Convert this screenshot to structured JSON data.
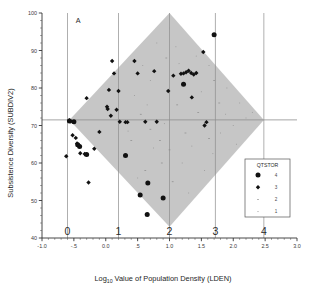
{
  "chart_data": {
    "type": "scatter",
    "title": "",
    "panel_label": "A",
    "xlabel": "Log10 Value of Population Density (LDEN)",
    "xlabel_parts": {
      "pre": "Log",
      "sub": "10",
      "post": " Value of Population Density (LDEN)"
    },
    "ylabel": "Subsistence Diversity (SUBDIV2)",
    "xlim": [
      -1.0,
      3.0
    ],
    "ylim": [
      40,
      100
    ],
    "x_ticks": [
      -1.0,
      -0.5,
      0.0,
      0.5,
      1.0,
      1.5,
      2.0,
      2.5,
      3.0
    ],
    "x_tick_labels": [
      "-1.0",
      "-.5",
      "0.0",
      ".5",
      "1.0",
      "1.5",
      "2.0",
      "2.5",
      "3.0"
    ],
    "x_minor_step": 0.1,
    "y_ticks": [
      40,
      50,
      60,
      70,
      80,
      90,
      100
    ],
    "y_tick_labels": [
      "40",
      "50",
      "60",
      "70",
      "80",
      "90",
      "100"
    ],
    "y_minor_step": 2,
    "grid": "reference-lines-only",
    "secondary_x_axis": {
      "note": "Untransformed population density class labels drawn above the x axis",
      "labels": [
        "0",
        "1",
        "2",
        "3",
        "4"
      ],
      "x_positions": [
        -0.6,
        0.2,
        1.0,
        1.72,
        2.48
      ]
    },
    "reference_lines": {
      "horizontal_y": 71.5,
      "vertical_x": [
        -0.6,
        0.2,
        1.0,
        1.72,
        2.48
      ]
    },
    "shaded_region": {
      "shape": "diamond",
      "fill": "#c6c6c6",
      "vertices": [
        [
          1.0,
          100.0
        ],
        [
          2.48,
          71.5
        ],
        [
          1.0,
          43.0
        ],
        [
          -0.57,
          71.5
        ]
      ]
    },
    "legend": {
      "title": "QTSTOR",
      "position": "right-inside",
      "entries": [
        {
          "label": "4",
          "marker": "circle",
          "size": 5.0
        },
        {
          "label": "3",
          "marker": "diamond",
          "size": 4.4
        },
        {
          "label": "2",
          "marker": "dash",
          "size": 1.8
        },
        {
          "label": "1",
          "marker": "dot",
          "size": 1.0
        }
      ]
    },
    "series": [
      {
        "name": "QTSTOR = 4",
        "marker": "circle",
        "color": "#111111",
        "points": [
          [
            -0.57,
            71.2
          ],
          [
            -0.5,
            71.0
          ],
          [
            -0.44,
            64.9
          ],
          [
            -0.41,
            64.4
          ],
          [
            -0.3,
            62.3
          ],
          [
            0.31,
            62.0
          ],
          [
            0.66,
            54.7
          ],
          [
            0.9,
            50.7
          ],
          [
            0.54,
            51.5
          ],
          [
            0.65,
            46.3
          ],
          [
            1.22,
            81.0
          ],
          [
            1.7,
            94.2
          ]
        ]
      },
      {
        "name": "QTSTOR = 3",
        "marker": "diamond",
        "color": "#111111",
        "points": [
          [
            -0.62,
            61.8
          ],
          [
            -0.57,
            71.4
          ],
          [
            -0.55,
            71.1
          ],
          [
            -0.52,
            67.4
          ],
          [
            -0.47,
            66.7
          ],
          [
            -0.45,
            65.2
          ],
          [
            -0.42,
            64.6
          ],
          [
            -0.4,
            62.6
          ],
          [
            -0.33,
            62.4
          ],
          [
            -0.3,
            77.3
          ],
          [
            -0.27,
            54.8
          ],
          [
            -0.18,
            63.8
          ],
          [
            -0.1,
            68.3
          ],
          [
            0.02,
            75.0
          ],
          [
            0.03,
            74.4
          ],
          [
            0.05,
            79.5
          ],
          [
            0.08,
            72.6
          ],
          [
            0.1,
            87.2
          ],
          [
            0.13,
            83.9
          ],
          [
            0.17,
            74.2
          ],
          [
            0.2,
            79.2
          ],
          [
            0.22,
            71.0
          ],
          [
            0.31,
            70.9
          ],
          [
            0.34,
            70.9
          ],
          [
            0.45,
            87.2
          ],
          [
            0.5,
            83.9
          ],
          [
            0.62,
            71.0
          ],
          [
            0.8,
            71.0
          ],
          [
            0.76,
            84.5
          ],
          [
            0.98,
            79.2
          ],
          [
            1.06,
            83.3
          ],
          [
            1.18,
            83.8
          ],
          [
            1.22,
            83.9
          ],
          [
            1.26,
            84.2
          ],
          [
            1.3,
            84.6
          ],
          [
            1.34,
            84.0
          ],
          [
            1.38,
            83.6
          ],
          [
            1.42,
            84.0
          ],
          [
            1.35,
            77.5
          ],
          [
            1.53,
            89.6
          ],
          [
            1.55,
            70.0
          ],
          [
            1.58,
            70.9
          ]
        ]
      },
      {
        "name": "QTSTOR = 2",
        "marker": "dash",
        "color": "#8a8a8a",
        "points": [
          [
            0.55,
            73.0
          ],
          [
            0.7,
            69.0
          ],
          [
            0.85,
            66.0
          ],
          [
            1.0,
            63.5
          ],
          [
            1.12,
            75.5
          ],
          [
            1.25,
            68.0
          ],
          [
            0.62,
            58.0
          ],
          [
            0.95,
            88.0
          ],
          [
            1.45,
            73.5
          ],
          [
            1.62,
            66.5
          ],
          [
            0.4,
            66.0
          ],
          [
            1.78,
            76.0
          ],
          [
            0.88,
            60.0
          ],
          [
            1.05,
            55.0
          ],
          [
            1.7,
            82.0
          ]
        ]
      },
      {
        "name": "QTSTOR = 1",
        "marker": "dot",
        "color": "#9a9a9a",
        "points": [
          [
            0.45,
            78.0
          ],
          [
            0.58,
            86.0
          ],
          [
            0.75,
            64.0
          ],
          [
            0.92,
            70.5
          ],
          [
            1.1,
            91.0
          ],
          [
            1.2,
            60.0
          ],
          [
            1.35,
            64.5
          ],
          [
            1.5,
            79.0
          ],
          [
            1.62,
            86.0
          ],
          [
            1.88,
            73.0
          ],
          [
            2.0,
            70.0
          ],
          [
            2.1,
            76.0
          ],
          [
            0.5,
            56.0
          ],
          [
            0.7,
            82.0
          ],
          [
            1.0,
            96.0
          ],
          [
            1.3,
            52.0
          ],
          [
            1.55,
            58.0
          ],
          [
            1.8,
            68.0
          ],
          [
            2.2,
            72.0
          ],
          [
            0.35,
            68.5
          ],
          [
            0.8,
            92.0
          ],
          [
            1.42,
            88.5
          ],
          [
            1.9,
            80.0
          ],
          [
            2.3,
            73.5
          ],
          [
            0.65,
            75.5
          ],
          [
            1.15,
            86.5
          ],
          [
            1.68,
            62.5
          ],
          [
            2.05,
            65.0
          ]
        ]
      }
    ]
  }
}
